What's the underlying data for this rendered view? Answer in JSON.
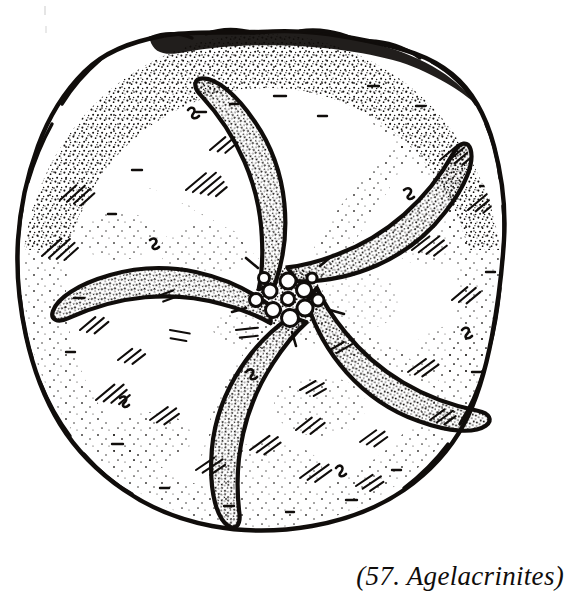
{
  "figure": {
    "caption": "(57. Agelacrinites)",
    "number": "57",
    "genus": "Agelacrinites",
    "style": "pen-and-ink stipple and hatch line drawing",
    "ink_color": "#100d0b",
    "paper_color": "#ffffff"
  },
  "specimen": {
    "disc": {
      "label": "theca outline",
      "center_x": 262,
      "center_y": 282,
      "radius_x": 243,
      "radius_y": 252,
      "outline_style": "irregular wavy thick line",
      "rim_shading": "dense stipple heaviest along upper and upper-left margin"
    },
    "mouth": {
      "label": "central oral plate cluster",
      "center_x": 288,
      "center_y": 298,
      "radius": 34,
      "plate_count": 11
    },
    "arms": [
      {
        "name": "ambulacrum-1",
        "position": "upper-left",
        "rotation": -62,
        "tip_direction": "west",
        "curl": "counterclockwise"
      },
      {
        "name": "ambulacrum-2",
        "position": "left",
        "rotation": -134,
        "tip_direction": "south-west",
        "curl": "counterclockwise"
      },
      {
        "name": "ambulacrum-3",
        "position": "lower-left",
        "rotation": -206,
        "tip_direction": "south",
        "curl": "counterclockwise"
      },
      {
        "name": "ambulacrum-4",
        "position": "lower-right",
        "rotation": -278,
        "tip_direction": "east",
        "curl": "counterclockwise"
      },
      {
        "name": "ambulacrum-5",
        "position": "upper-right",
        "rotation": -350,
        "tip_direction": "north",
        "curl": "counterclockwise"
      }
    ],
    "arm_count": 5
  }
}
